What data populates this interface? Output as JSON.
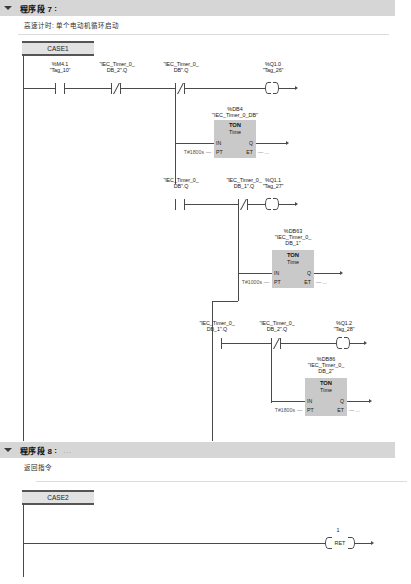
{
  "networks": [
    {
      "id": "network-7",
      "title": "程序段 7",
      "colon": ":",
      "dots": "...",
      "comment": "高速计时: 单个电动机循环启动",
      "case_label": "CASE1",
      "rungs": [
        {
          "contacts": [
            {
              "addr": "%M4.1",
              "tag": "\"Tag_10\"",
              "type": "no"
            },
            {
              "addr": "\"IEC_Timer_0_",
              "tag": "DB_2\".Q",
              "type": "nc"
            },
            {
              "addr": "\"IEC_Timer_0_",
              "tag": "DB\".Q",
              "type": "nc"
            }
          ],
          "output": {
            "addr": "%Q1.0",
            "tag": "\"Tag_26\""
          }
        },
        {
          "contacts": [
            {
              "addr": "\"IEC_Timer_0_",
              "tag": "DB\".Q",
              "type": "no"
            },
            {
              "addr": "\"IEC_Timer_0_",
              "tag": "DB_1\".Q",
              "type": "nc"
            }
          ],
          "output": {
            "addr": "%Q1.1",
            "tag": "\"Tag_27\""
          }
        },
        {
          "contacts": [
            {
              "addr": "\"IEC_Timer_0_",
              "tag": "DB_1\".Q",
              "type": "no"
            },
            {
              "addr": "\"IEC_Timer_0_",
              "tag": "DB_2\".Q",
              "type": "nc"
            }
          ],
          "output": {
            "addr": "%Q1.2",
            "tag": "\"Tag_28\""
          }
        }
      ],
      "timers": [
        {
          "db": "%DB4",
          "instance": "\"IEC_Timer_0_DB\"",
          "kind": "TON",
          "datatype": "Time",
          "pt": "T#1800s",
          "pins": {
            "in": "IN",
            "pt": "PT",
            "q": "Q",
            "et": "ET"
          },
          "et_value": "..."
        },
        {
          "db": "%DB63",
          "instance": "\"IEC_Timer_0_",
          "instance2": "DB_1\"",
          "kind": "TON",
          "datatype": "Time",
          "pt": "T#1000s",
          "pins": {
            "in": "IN",
            "pt": "PT",
            "q": "Q",
            "et": "ET"
          },
          "et_value": "..."
        },
        {
          "db": "%DB86",
          "instance": "\"IEC_Timer_0_",
          "instance2": "DB_2\"",
          "kind": "TON",
          "datatype": "Time",
          "pt": "T#1800s",
          "pins": {
            "in": "IN",
            "pt": "PT",
            "q": "Q",
            "et": "ET"
          },
          "et_value": "..."
        }
      ]
    },
    {
      "id": "network-8",
      "title": "程序段 8",
      "colon": ":",
      "dots": "...",
      "comment": "返回指令",
      "case_label": "CASE2",
      "ret": {
        "label": "RET",
        "value": "1"
      }
    }
  ]
}
